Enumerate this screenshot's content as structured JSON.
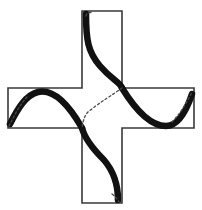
{
  "figure": {
    "caption": "(A)",
    "background_color": "#ffffff",
    "outline_color": "#3a3a3a",
    "curve_color": "#111111",
    "dash_color": "#4a4a4a",
    "caption_color": "#b8b8b8",
    "outline_width": 1.6,
    "curve_width": 6.5,
    "dash_width": 1.3,
    "shape_name": "plus-cross-outline",
    "geometry": {
      "left": 8,
      "right": 194,
      "top": 11,
      "bottom": 203,
      "inner_left": 82,
      "inner_right": 122,
      "inner_top": 88,
      "inner_bottom": 128,
      "center_x": 102,
      "center_y": 108,
      "arm_width": 40
    },
    "cross_outline_path": "M 82 11 L 122 11 L 122 88 L 194 88 L 194 128 L 122 128 L 122 203 L 82 203 L 82 128 L 8 128 L 8 88 L 82 88 Z",
    "curves": [
      {
        "name": "top-arm-s-curve",
        "path": "M 86 14 C 86 40, 88 52, 100 66 C 112 80, 120 82, 122 88",
        "style": "thick"
      },
      {
        "name": "upper-center-diagonal",
        "path": "M 122 88 C 114 94, 100 102, 88 112 C 85 115, 83 120, 82 128",
        "style": "thin-dashed"
      },
      {
        "name": "left-arm-curve",
        "path": "M 10 124 C 18 108, 26 95, 38 92 C 52 89, 66 100, 82 128",
        "style": "thick"
      },
      {
        "name": "left-arm-entry-dash",
        "path": "M 9 126 C 14 116, 20 104, 28 96",
        "style": "thin-dashed"
      },
      {
        "name": "right-arm-curve",
        "path": "M 122 88 C 138 114, 152 126, 166 126 C 178 126, 186 112, 192 94",
        "style": "thick"
      },
      {
        "name": "right-arm-exit-dash",
        "path": "M 172 122 C 180 114, 187 102, 192 92",
        "style": "thin-dashed"
      },
      {
        "name": "bottom-arm-s-curve",
        "path": "M 82 128 C 84 136, 92 148, 104 160 C 116 174, 118 188, 118 200",
        "style": "thick"
      },
      {
        "name": "bottom-arm-exit-dash",
        "path": "M 112 194 C 116 197, 118 200, 119 202",
        "style": "thin-dashed"
      },
      {
        "name": "top-arm-entry-dash",
        "path": "M 86 16 C 86 14, 88 13, 92 12",
        "style": "thin-dashed"
      }
    ]
  }
}
